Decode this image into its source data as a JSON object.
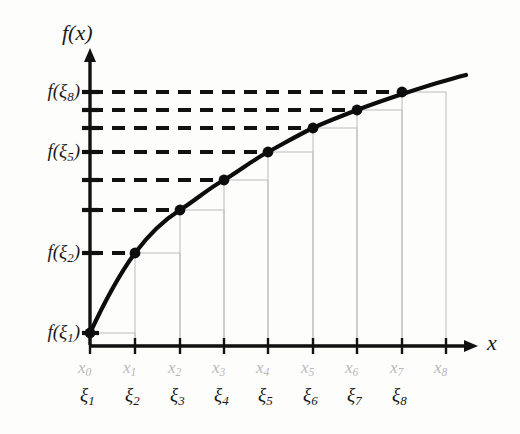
{
  "figure": {
    "kind": "riemann-sum-diagram",
    "background_color": "#fdfdfc"
  },
  "axes": {
    "y_axis_label": "f(x)",
    "x_axis_label": "x",
    "axis_color": "#111111",
    "origin_px": {
      "x": 90,
      "y": 345
    },
    "x_axis_end_px": 478,
    "y_axis_top_px": 48
  },
  "y_ticks": [
    {
      "label": "f(ξ₈)",
      "show_label": true,
      "y_px": 92,
      "value_index": 8
    },
    {
      "label": "f(ξ₇)",
      "show_label": false,
      "y_px": 110,
      "value_index": 7
    },
    {
      "label": "f(ξ₆)",
      "show_label": false,
      "y_px": 128,
      "value_index": 6
    },
    {
      "label": "f(ξ₅)",
      "show_label": true,
      "y_px": 152,
      "value_index": 5
    },
    {
      "label": "f(ξ₄)",
      "show_label": false,
      "y_px": 180,
      "value_index": 4
    },
    {
      "label": "f(ξ₃)",
      "show_label": false,
      "y_px": 210,
      "value_index": 3
    },
    {
      "label": "f(ξ₂)",
      "show_label": true,
      "y_px": 253,
      "value_index": 2
    },
    {
      "label": "f(ξ₁)",
      "show_label": true,
      "y_px": 333,
      "value_index": 1
    }
  ],
  "x_nodes": [
    {
      "label": "x₀",
      "x_px": 90
    },
    {
      "label": "x₁",
      "x_px": 135
    },
    {
      "label": "x₂",
      "x_px": 180
    },
    {
      "label": "x₃",
      "x_px": 224
    },
    {
      "label": "x₄",
      "x_px": 268
    },
    {
      "label": "x₅",
      "x_px": 313
    },
    {
      "label": "x₆",
      "x_px": 357
    },
    {
      "label": "x₇",
      "x_px": 402
    },
    {
      "label": "x₈",
      "x_px": 446
    }
  ],
  "xi_labels": [
    {
      "label": "ξ₁",
      "x_px": 90
    },
    {
      "label": "ξ₂",
      "x_px": 135
    },
    {
      "label": "ξ₃",
      "x_px": 180
    },
    {
      "label": "ξ₄",
      "x_px": 224
    },
    {
      "label": "ξ₅",
      "x_px": 268
    },
    {
      "label": "ξ₆",
      "x_px": 313
    },
    {
      "label": "ξ₇",
      "x_px": 357
    },
    {
      "label": "ξ₈",
      "x_px": 402
    }
  ],
  "chart_data": {
    "type": "line",
    "title": "",
    "xlabel": "x",
    "ylabel": "f(x)",
    "grid": false,
    "legend": "none",
    "x": [
      90,
      135,
      180,
      224,
      268,
      313,
      357,
      402,
      446
    ],
    "x_tick_labels": [
      "x₀",
      "x₁",
      "x₂",
      "x₃",
      "x₄",
      "x₅",
      "x₆",
      "x₇",
      "x₈"
    ],
    "sample_point_labels": [
      "ξ₁",
      "ξ₂",
      "ξ₃",
      "ξ₄",
      "ξ₅",
      "ξ₆",
      "ξ₇",
      "ξ₈"
    ],
    "y_tick_labels": [
      "f(ξ₁)",
      "f(ξ₂)",
      "f(ξ₃)",
      "f(ξ₄)",
      "f(ξ₅)",
      "f(ξ₆)",
      "f(ξ₇)",
      "f(ξ₈)"
    ],
    "marked_points_px": [
      {
        "label": "ξ₁",
        "x": 90,
        "y": 333
      },
      {
        "label": "ξ₂",
        "x": 135,
        "y": 253
      },
      {
        "label": "ξ₃",
        "x": 180,
        "y": 210
      },
      {
        "label": "ξ₄",
        "x": 224,
        "y": 180
      },
      {
        "label": "ξ₅",
        "x": 268,
        "y": 152
      },
      {
        "label": "ξ₆",
        "x": 313,
        "y": 128
      },
      {
        "label": "ξ₇",
        "x": 357,
        "y": 110
      },
      {
        "label": "ξ₈",
        "x": 402,
        "y": 92
      }
    ],
    "curve_path_px": "M 90 333 C 104 303, 118 276, 135 253 C 150 233, 164 220, 180 210 C 196 200, 209 188, 224 180 C 239 171, 253 160, 268 152 C 283 144, 298 135, 313 128 C 328 121, 342 116, 357 110 C 375 103, 430 84, 466 75",
    "rectangles_px": [
      {
        "index": 1,
        "x_left": 90,
        "x_right": 135,
        "top_y": 333,
        "base_y": 345
      },
      {
        "index": 2,
        "x_left": 135,
        "x_right": 180,
        "top_y": 253,
        "base_y": 345
      },
      {
        "index": 3,
        "x_left": 180,
        "x_right": 224,
        "top_y": 210,
        "base_y": 345
      },
      {
        "index": 4,
        "x_left": 224,
        "x_right": 268,
        "top_y": 180,
        "base_y": 345
      },
      {
        "index": 5,
        "x_left": 268,
        "x_right": 313,
        "top_y": 152,
        "base_y": 345
      },
      {
        "index": 6,
        "x_left": 313,
        "x_right": 357,
        "top_y": 128,
        "base_y": 345
      },
      {
        "index": 7,
        "x_left": 357,
        "x_right": 402,
        "top_y": 110,
        "base_y": 345
      },
      {
        "index": 8,
        "x_left": 402,
        "x_right": 446,
        "top_y": 92,
        "base_y": 345
      }
    ],
    "dashed_guides_px": [
      {
        "y": 92,
        "x_start": 90,
        "x_end": 404
      },
      {
        "y": 110,
        "x_start": 90,
        "x_end": 360
      },
      {
        "y": 128,
        "x_start": 90,
        "x_end": 315
      },
      {
        "y": 152,
        "x_start": 90,
        "x_end": 270
      },
      {
        "y": 180,
        "x_start": 90,
        "x_end": 226
      },
      {
        "y": 210,
        "x_start": 90,
        "x_end": 182
      },
      {
        "y": 253,
        "x_start": 90,
        "x_end": 137
      }
    ]
  },
  "colors": {
    "curve": "#0d0d0d",
    "point": "#0d0d0d",
    "dashed_guide": "#111111",
    "rectangle_outline": "#c2c2c2",
    "axis": "#111111",
    "x_node_label": "#b9b9b9",
    "xi_label": "#161616",
    "tick_label": "#1a1a1a"
  }
}
